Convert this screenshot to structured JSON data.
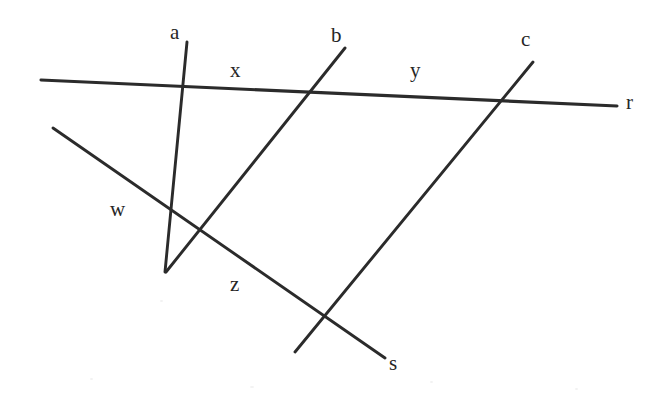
{
  "figure": {
    "kind": "geometry-diagram",
    "background_color": "#ffffff",
    "line_color": "#2b2b2b",
    "label_color": "#262626",
    "width": 663,
    "height": 397
  },
  "labels": {
    "a": "a",
    "b": "b",
    "c": "c",
    "r": "r",
    "s": "s",
    "w": "w",
    "x": "x",
    "y": "y",
    "z": "z"
  },
  "chart_data": {
    "type": "diagram",
    "title": "",
    "lines": [
      {
        "name": "r",
        "label": "r",
        "role": "transversal",
        "x1": 41,
        "y1": 80,
        "x2": 617,
        "y2": 106,
        "label_x": 626,
        "label_y": 92
      },
      {
        "name": "a",
        "label": "a",
        "role": "cut-line",
        "x1": 187,
        "y1": 42,
        "x2": 165,
        "y2": 272,
        "label_x": 170,
        "label_y": 22
      },
      {
        "name": "b",
        "label": "b",
        "role": "cut-line",
        "x1": 345,
        "y1": 48,
        "x2": 166,
        "y2": 272,
        "label_x": 331,
        "label_y": 25
      },
      {
        "name": "c",
        "label": "c",
        "role": "cut-line",
        "x1": 533,
        "y1": 62,
        "x2": 295,
        "y2": 352,
        "label_x": 521,
        "label_y": 29
      },
      {
        "name": "s",
        "label": "s",
        "role": "transversal",
        "x1": 53,
        "y1": 128,
        "x2": 385,
        "y2": 358,
        "label_x": 389,
        "label_y": 353
      }
    ],
    "segment_labels": [
      {
        "name": "x",
        "label": "x",
        "on_line": "r",
        "between": [
          "a",
          "b"
        ],
        "label_x": 230,
        "label_y": 60
      },
      {
        "name": "y",
        "label": "y",
        "on_line": "r",
        "between": [
          "b",
          "c"
        ],
        "label_x": 410,
        "label_y": 60
      },
      {
        "name": "w",
        "label": "w",
        "on_line": "s",
        "between": [
          "a",
          "b"
        ],
        "label_x": 110,
        "label_y": 199
      },
      {
        "name": "z",
        "label": "z",
        "on_line": "s",
        "between": [
          "b",
          "c"
        ],
        "label_x": 230,
        "label_y": 274
      }
    ],
    "intersections": [
      {
        "lines": [
          "r",
          "a"
        ],
        "x": 155,
        "y": 85
      },
      {
        "lines": [
          "r",
          "b"
        ],
        "x": 310,
        "y": 92
      },
      {
        "lines": [
          "r",
          "c"
        ],
        "x": 497,
        "y": 100
      },
      {
        "lines": [
          "s",
          "a"
        ],
        "x": 96,
        "y": 158
      },
      {
        "lines": [
          "s",
          "b"
        ],
        "x": 200,
        "y": 233
      },
      {
        "lines": [
          "s",
          "c"
        ],
        "x": 320,
        "y": 318
      }
    ]
  }
}
